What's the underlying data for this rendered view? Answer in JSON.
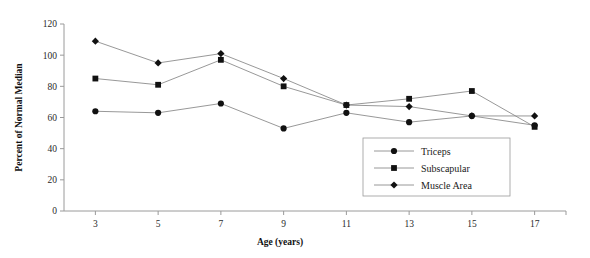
{
  "chart_data": {
    "type": "line",
    "title": "",
    "xlabel": "Age (years)",
    "ylabel": "Percent of Normal Median",
    "x": [
      3,
      5,
      7,
      9,
      11,
      13,
      15,
      17
    ],
    "xticklabels": [
      "3",
      "5",
      "7",
      "9",
      "11",
      "13",
      "15",
      "17"
    ],
    "yticks": [
      0,
      20,
      40,
      60,
      80,
      100,
      120
    ],
    "yticklabels": [
      "0",
      "20",
      "40",
      "60",
      "80",
      "100",
      "120"
    ],
    "xlim": [
      2,
      18
    ],
    "ylim": [
      0,
      120
    ],
    "grid": false,
    "legend_position": "inside-lower-right",
    "series": [
      {
        "name": "Triceps",
        "marker": "circle",
        "values": [
          64,
          63,
          69,
          53,
          63,
          57,
          61,
          55
        ]
      },
      {
        "name": "Subscapular",
        "marker": "square",
        "values": [
          85,
          81,
          97,
          80,
          68,
          72,
          77,
          54
        ]
      },
      {
        "name": "Muscle Area",
        "marker": "diamond",
        "values": [
          109,
          95,
          101,
          85,
          68,
          67,
          61,
          61
        ]
      }
    ]
  },
  "colors": {
    "line": "#8c8c8c",
    "marker": "#111111",
    "axis": "#9a9a9a",
    "text": "#1a1a1a",
    "background": "#ffffff"
  },
  "legend": {
    "items": [
      {
        "label": "Triceps",
        "marker": "circle"
      },
      {
        "label": "Subscapular",
        "marker": "square"
      },
      {
        "label": "Muscle Area",
        "marker": "diamond"
      }
    ]
  }
}
